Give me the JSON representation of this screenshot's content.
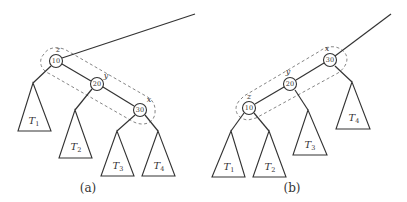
{
  "diagram": {
    "type": "tree-restructure",
    "panels": [
      {
        "caption": "(a)",
        "nodes": [
          {
            "var": "z",
            "key": "10"
          },
          {
            "var": "y",
            "key": "20"
          },
          {
            "var": "x",
            "key": "30"
          }
        ],
        "subtrees": [
          {
            "name": "T",
            "sub": "1"
          },
          {
            "name": "T",
            "sub": "2"
          },
          {
            "name": "T",
            "sub": "3"
          },
          {
            "name": "T",
            "sub": "4"
          }
        ]
      },
      {
        "caption": "(b)",
        "nodes": [
          {
            "var": "z",
            "key": "10"
          },
          {
            "var": "y",
            "key": "20"
          },
          {
            "var": "x",
            "key": "30"
          }
        ],
        "subtrees": [
          {
            "name": "T",
            "sub": "1"
          },
          {
            "name": "T",
            "sub": "2"
          },
          {
            "name": "T",
            "sub": "3"
          },
          {
            "name": "T",
            "sub": "4"
          }
        ]
      }
    ]
  }
}
